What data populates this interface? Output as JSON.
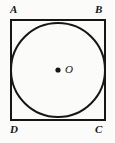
{
  "figure": {
    "name": "square-with-inscribed-circle",
    "canvas": {
      "width": 115,
      "height": 143
    },
    "background_color": "#fbfbfa",
    "stroke_color": "#161616",
    "square": {
      "x": 11,
      "y": 20,
      "width": 94,
      "height": 100,
      "stroke_width": 2
    },
    "circle": {
      "cx": 58,
      "cy": 70,
      "r": 47,
      "stroke_width": 2,
      "fill": "none"
    },
    "center_dot": {
      "cx": 58,
      "cy": 70,
      "r": 2.6,
      "fill": "#161616"
    },
    "vertex_labels": {
      "top_left": "A",
      "top_right": "B",
      "bottom_right": "C",
      "bottom_left": "D"
    },
    "center_label": "O"
  }
}
